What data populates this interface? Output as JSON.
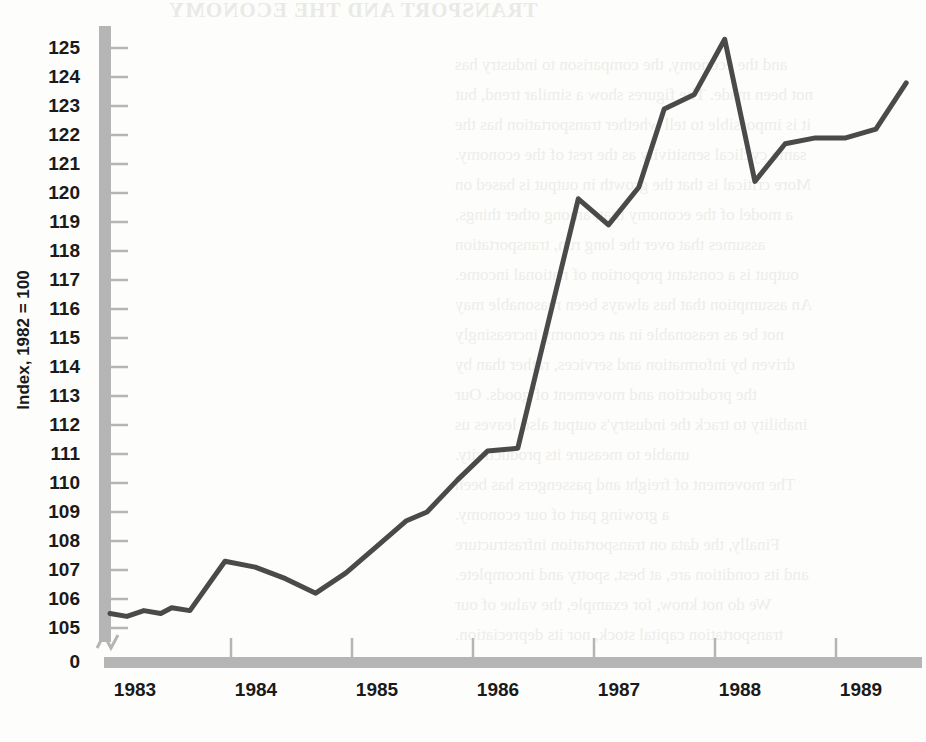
{
  "page": {
    "background_color": "#fdfdfc",
    "width": 926,
    "height": 742
  },
  "bleed_through": {
    "title": "TRANSPORT AND THE ECONOMY",
    "lines": [
      "and the economy, the comparison to industry has",
      "not been made. The figures show a similar trend, but",
      "it is impossible to tell whether transportation has the",
      "same cyclical sensitivity as the rest of the economy.",
      "More critical is that the growth in output is based on",
      "a model of the economy that, among other things,",
      "assumes that over the long run, transportation",
      "output is a constant proportion of national income.",
      "An assumption that has always been reasonable may",
      "not be as reasonable in an economy increasingly",
      "driven by information and services, rather than by",
      "the production and movement of goods. Our",
      "inability to track the industry's output also leaves us",
      "unable to measure its productivity.",
      "The movement of freight and passengers has been",
      "a growing part of our economy.",
      "Finally, the data on transportation infrastructure",
      "and its condition are, at best, spotty and incomplete.",
      "We do not know, for example, the value of our",
      "transportation capital stock, nor its depreciation."
    ]
  },
  "chart_data": {
    "type": "line",
    "title": "",
    "subtitle": "",
    "xlabel": "",
    "ylabel": "Index, 1982 = 100",
    "ylim": [
      105,
      125.5
    ],
    "y_ticks": [
      105,
      106,
      107,
      108,
      109,
      110,
      111,
      112,
      113,
      114,
      115,
      116,
      117,
      118,
      119,
      120,
      121,
      122,
      123,
      124,
      125
    ],
    "y_zero_label": "0",
    "y_axis_break": true,
    "xlim": [
      1983.0,
      1989.92
    ],
    "x_ticks": [
      1983,
      1984,
      1985,
      1986,
      1987,
      1988,
      1989
    ],
    "x_tick_labels": [
      "1983",
      "1984",
      "1985",
      "1986",
      "1987",
      "1988",
      "1989"
    ],
    "grid": false,
    "legend": false,
    "line_color": "#4a4a4a",
    "axis_color": "#b0b0b0",
    "series": [
      {
        "name": "Transportation output index",
        "x": [
          1983.0,
          1983.14,
          1983.28,
          1983.42,
          1983.51,
          1983.66,
          1983.95,
          1984.2,
          1984.45,
          1984.7,
          1984.95,
          1985.2,
          1985.45,
          1985.62,
          1985.87,
          1986.12,
          1986.37,
          1986.62,
          1986.87,
          1987.12,
          1987.37,
          1987.58,
          1987.83,
          1988.08,
          1988.33,
          1988.58,
          1988.83,
          1989.08,
          1989.33,
          1989.58
        ],
        "values": [
          105.5,
          105.4,
          105.6,
          105.5,
          105.7,
          105.6,
          107.3,
          107.1,
          106.7,
          106.2,
          106.9,
          107.8,
          108.7,
          109.0,
          110.1,
          111.1,
          111.2,
          115.5,
          119.8,
          118.9,
          120.2,
          122.9,
          123.4,
          125.3,
          120.4,
          121.7,
          121.9,
          121.9,
          122.2,
          123.8
        ]
      }
    ]
  }
}
